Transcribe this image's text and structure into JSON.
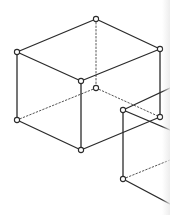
{
  "diagram": {
    "type": "wireframe-boxes",
    "colors": {
      "line": "#2b2b2b",
      "hidden": "#555555",
      "vertex_fill": "#ffffff",
      "background": "#ffffff"
    },
    "stroke": {
      "solid": 1.3,
      "hidden": 1.0,
      "dash": "1.5 2"
    },
    "vertex_radius": 2.6,
    "shapes": [
      {
        "name": "cube-1",
        "vertices": [
          [
            96,
            19
          ],
          [
            17,
            52
          ],
          [
            160,
            49
          ],
          [
            81,
            81
          ],
          [
            17,
            120
          ],
          [
            81,
            150
          ],
          [
            160,
            117
          ],
          [
            96,
            88
          ]
        ],
        "solid_edges": [
          [
            0,
            1
          ],
          [
            0,
            2
          ],
          [
            1,
            3
          ],
          [
            2,
            3
          ],
          [
            1,
            4
          ],
          [
            3,
            5
          ],
          [
            2,
            6
          ],
          [
            4,
            5
          ],
          [
            5,
            6
          ]
        ],
        "hidden_edges": [
          [
            0,
            7
          ],
          [
            7,
            4
          ],
          [
            7,
            6
          ]
        ]
      },
      {
        "name": "cube-2-partial",
        "vertices": [
          [
            123,
            110
          ],
          [
            123,
            179
          ]
        ],
        "solid_edges": [
          [
            0,
            1
          ]
        ],
        "open_solid_lines": [
          [
            [
              123,
              110
            ],
            [
              170,
              88
            ]
          ],
          [
            [
              123,
              110
            ],
            [
              170,
              130
            ]
          ],
          [
            [
              123,
              179
            ],
            [
              170,
              204
            ]
          ]
        ],
        "open_hidden_lines": [
          [
            [
              123,
              179
            ],
            [
              170,
              160
            ]
          ]
        ]
      }
    ]
  }
}
